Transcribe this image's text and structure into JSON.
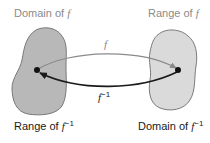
{
  "labels": {
    "domain_f": {
      "prefix": "Domain of ",
      "func": "f"
    },
    "range_f": {
      "prefix": "Range of ",
      "func": "f"
    },
    "range_f_inv": {
      "prefix": "Range of ",
      "func": "f",
      "sup": "−1"
    },
    "domain_f_inv": {
      "prefix": "Domain of ",
      "func": "f",
      "sup": "−1"
    }
  },
  "arrows": {
    "f": {
      "label": "f",
      "color": "#8a8a8a",
      "direction": "left-to-right"
    },
    "f_inverse": {
      "label": "f",
      "sup": "−1",
      "color": "#1a1a1a",
      "direction": "right-to-left"
    }
  },
  "colors": {
    "left_blob_fill": "#b8b8b8",
    "right_blob_fill": "#dadada",
    "blob_stroke": "#6e6e6e",
    "top_label": "#8a8a8a",
    "bottom_label": "#1a1a1a"
  }
}
